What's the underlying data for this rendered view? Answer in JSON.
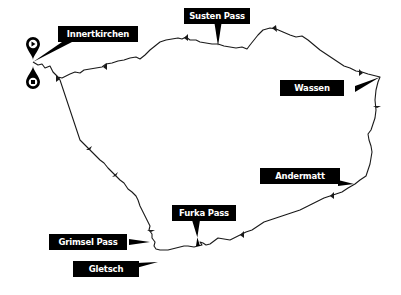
{
  "map": {
    "title": "",
    "route_color": "#1a1a1a",
    "label_bg": "#000000",
    "label_fg": "#ffffff",
    "markers": {
      "start": {
        "icon": "play-pin-icon"
      },
      "end": {
        "icon": "stop-pin-icon"
      }
    },
    "labels": [
      {
        "id": "innertkirchen",
        "text": "Innertkirchen"
      },
      {
        "id": "susten-pass",
        "text": "Susten Pass"
      },
      {
        "id": "wassen",
        "text": "Wassen"
      },
      {
        "id": "andermatt",
        "text": "Andermatt"
      },
      {
        "id": "furka-pass",
        "text": "Furka Pass"
      },
      {
        "id": "grimsel-pass",
        "text": "Grimsel Pass"
      },
      {
        "id": "gletsch",
        "text": "Gletsch"
      }
    ]
  }
}
